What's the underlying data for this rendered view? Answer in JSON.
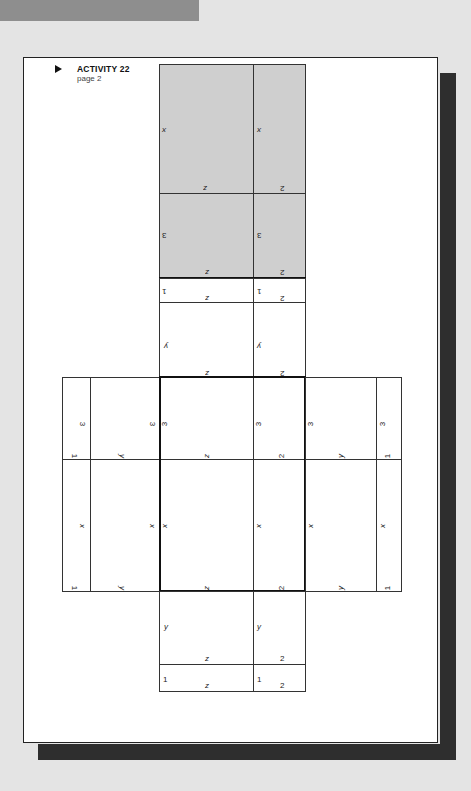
{
  "header": {
    "marker": "▶",
    "title": "ACTIVITY 22",
    "subtitle": "page 2"
  },
  "net": {
    "shaded_top": {
      "left": {
        "side": "x",
        "bottom": "z"
      },
      "right": {
        "side": "x",
        "bottom": "2"
      }
    },
    "shaded_second": {
      "left": {
        "side": "3",
        "bottom": "z"
      },
      "right": {
        "side": "3",
        "bottom": "2"
      }
    },
    "strip_top": {
      "left": {
        "corner": "1",
        "bottom": "z"
      },
      "right": {
        "corner": "1",
        "bottom": "2"
      }
    },
    "y_top": {
      "left": {
        "side": "y",
        "bottom": "z"
      },
      "right": {
        "side": "y",
        "bottom": "2"
      }
    },
    "center_top": {
      "left": {
        "side": "3",
        "bottom": "z"
      },
      "right": {
        "side": "3",
        "bottom": "2"
      }
    },
    "center_bottom": {
      "left": {
        "side": "x",
        "bottom": "z"
      },
      "right": {
        "side": "x",
        "bottom": "2"
      }
    },
    "left_flap_top": {
      "outer": "1",
      "outer_side": "3",
      "inner": "y",
      "inner_side": "3"
    },
    "left_flap_bottom": {
      "outer": "1",
      "outer_side": "x",
      "inner": "y",
      "inner_side": "x"
    },
    "right_flap_top": {
      "inner_side": "3",
      "inner": "y",
      "outer_side": "3",
      "outer": "1"
    },
    "right_flap_bottom": {
      "inner_side": "x",
      "inner": "y",
      "outer_side": "x",
      "outer": "1"
    },
    "y_bottom": {
      "left": {
        "side": "y",
        "bottom": "z"
      },
      "right": {
        "side": "y",
        "bottom": "2"
      }
    },
    "strip_bottom": {
      "left": {
        "corner": "1",
        "bottom": "z"
      },
      "right": {
        "corner": "1",
        "bottom": "2"
      }
    }
  }
}
